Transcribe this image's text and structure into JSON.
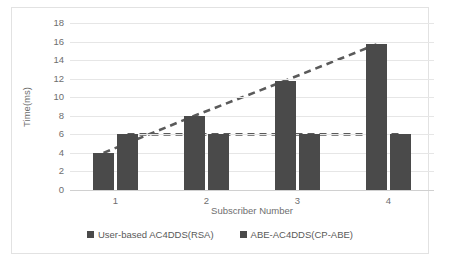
{
  "chart_data": {
    "type": "bar",
    "title": "",
    "xlabel": "Subscriber Number",
    "ylabel": "Time(ms)",
    "categories": [
      "1",
      "2",
      "3",
      "4"
    ],
    "series": [
      {
        "name": "User-based AC4DDS(RSA)",
        "values": [
          4,
          8,
          11.8,
          15.7
        ],
        "color": "#4a4a4a",
        "trendline": "dashed"
      },
      {
        "name": "ABE-AC4DDS(CP-ABE)",
        "values": [
          6,
          6,
          6,
          6
        ],
        "color": "#4a4a4a",
        "trendline": "dashed"
      }
    ],
    "ylim": [
      0,
      18
    ],
    "ytick_step": 2,
    "yticks": [
      "18",
      "16",
      "14",
      "12",
      "10",
      "8",
      "6",
      "4",
      "2",
      "0"
    ],
    "grid": true,
    "legend_position": "bottom",
    "colors": {
      "bar": "#4a4a4a",
      "gridline": "#e6e6e6",
      "axis_text": "#6e6e6e",
      "trendline": "#5a5a5a",
      "frame": "#e2e2e2"
    }
  }
}
